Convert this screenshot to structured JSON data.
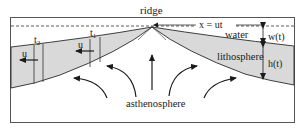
{
  "diagram": {
    "labels": {
      "ridge": "ridge",
      "distance": "x = ut",
      "water": "water",
      "water_depth": "w(t)",
      "lithosphere": "lithosphere",
      "lithosphere_thickness": "h(t)",
      "asthenosphere": "asthenosphere",
      "time_1": "t",
      "time_1_sub": "1",
      "time_2": "t",
      "time_2_sub": "2",
      "velocity_left_1": "u",
      "velocity_left_2": "u"
    },
    "colors": {
      "lithosphere_fill": "#d9d9d9",
      "line": "#2a2a2a",
      "background": "#ffffff"
    }
  }
}
